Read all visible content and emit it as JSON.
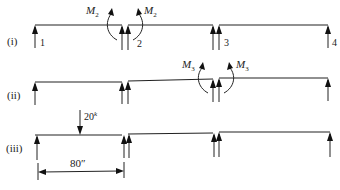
{
  "diagram": {
    "rows": [
      {
        "label": "(i)",
        "support_numbers": [
          "1",
          "2",
          "3",
          "4"
        ],
        "moments": [
          {
            "label": "M",
            "subscript": "2"
          },
          {
            "label": "M",
            "subscript": "2"
          }
        ]
      },
      {
        "label": "(ii)",
        "moments": [
          {
            "label": "M",
            "subscript": "3"
          },
          {
            "label": "M",
            "subscript": "3"
          }
        ]
      },
      {
        "label": "(iii)",
        "load": {
          "value": "20",
          "unit_superscript": "k"
        },
        "dimension": "80″"
      }
    ]
  }
}
